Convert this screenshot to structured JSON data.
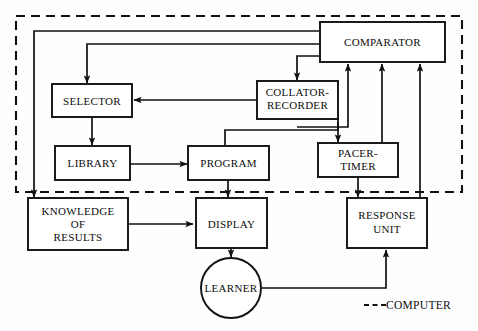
{
  "diagram": {
    "colors": {
      "stroke": "#111111",
      "background": "#fefefe",
      "box_fill": "#ffffff"
    },
    "boundary": {
      "label": "COMPUTER",
      "legend_text": "COMPUTER",
      "style": "dashed"
    },
    "nodes": [
      {
        "id": "comparator",
        "label": "COMPARATOR",
        "shape": "rect",
        "lines": [
          "COMPARATOR"
        ]
      },
      {
        "id": "selector",
        "label": "SELECTOR",
        "shape": "rect",
        "lines": [
          "SELECTOR"
        ]
      },
      {
        "id": "collator",
        "label": "COLLATOR-RECORDER",
        "shape": "rect",
        "lines": [
          "COLLATOR-",
          "RECORDER"
        ]
      },
      {
        "id": "library",
        "label": "LIBRARY",
        "shape": "rect",
        "lines": [
          "LIBRARY"
        ]
      },
      {
        "id": "program",
        "label": "PROGRAM",
        "shape": "rect",
        "lines": [
          "PROGRAM"
        ]
      },
      {
        "id": "pacer",
        "label": "PACER-TIMER",
        "shape": "rect",
        "lines": [
          "PACER-",
          "TIMER"
        ]
      },
      {
        "id": "knowledge",
        "label": "KNOWLEDGE OF RESULTS",
        "shape": "rect",
        "lines": [
          "KNOWLEDGE",
          "OF",
          "RESULTS"
        ]
      },
      {
        "id": "display",
        "label": "DISPLAY",
        "shape": "rect",
        "lines": [
          "DISPLAY"
        ]
      },
      {
        "id": "response",
        "label": "RESPONSE UNIT",
        "shape": "rect",
        "lines": [
          "RESPONSE",
          "UNIT"
        ]
      },
      {
        "id": "learner",
        "label": "LEARNER",
        "shape": "circle",
        "lines": [
          "LEARNER"
        ]
      }
    ],
    "node_text": {
      "comparator": "COMPARATOR",
      "selector": "SELECTOR",
      "collator_line1": "COLLATOR-",
      "collator_line2": "RECORDER",
      "library": "LIBRARY",
      "program": "PROGRAM",
      "pacer_line1": "PACER-",
      "pacer_line2": "TIMER",
      "knowledge_line1": "KNOWLEDGE",
      "knowledge_line2": "OF",
      "knowledge_line3": "RESULTS",
      "display": "DISPLAY",
      "response_line1": "RESPONSE",
      "response_line2": "UNIT",
      "learner": "LEARNER",
      "legend": "COMPUTER"
    },
    "edges": [
      {
        "from": "comparator",
        "to": "knowledge",
        "style": "solid",
        "arrow": "end"
      },
      {
        "from": "comparator",
        "to": "selector",
        "style": "solid",
        "arrow": "end"
      },
      {
        "from": "comparator",
        "to": "collator",
        "style": "solid",
        "arrow": "end"
      },
      {
        "from": "collator",
        "to": "selector",
        "style": "solid",
        "arrow": "end"
      },
      {
        "from": "selector",
        "to": "library",
        "style": "solid",
        "arrow": "end"
      },
      {
        "from": "library",
        "to": "program",
        "style": "solid",
        "arrow": "end"
      },
      {
        "from": "collator",
        "to": "pacer",
        "style": "solid",
        "arrow": "end"
      },
      {
        "from": "collator",
        "to": "comparator",
        "style": "solid",
        "arrow": "end"
      },
      {
        "from": "program",
        "to": "display",
        "style": "solid",
        "arrow": "end"
      },
      {
        "from": "pacer",
        "to": "response",
        "style": "solid",
        "arrow": "end"
      },
      {
        "from": "pacer",
        "to": "comparator",
        "style": "solid",
        "arrow": "end"
      },
      {
        "from": "response",
        "to": "comparator",
        "style": "solid",
        "arrow": "end"
      },
      {
        "from": "knowledge",
        "to": "display",
        "style": "solid",
        "arrow": "end"
      },
      {
        "from": "display",
        "to": "learner",
        "style": "solid",
        "arrow": "end"
      },
      {
        "from": "learner",
        "to": "response",
        "style": "solid",
        "arrow": "end"
      }
    ]
  }
}
